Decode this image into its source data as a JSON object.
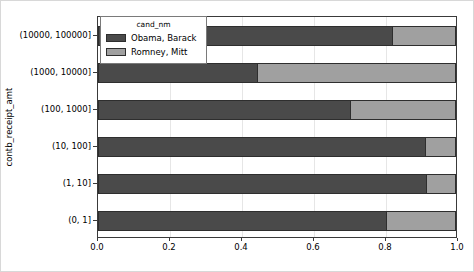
{
  "chart_data": {
    "type": "bar",
    "orientation": "horizontal",
    "stacked": true,
    "normalized": true,
    "title": "",
    "xlabel": "",
    "ylabel": "contb_receipt_amt",
    "xlim": [
      0.0,
      1.0
    ],
    "xticks": [
      "0.0",
      "0.2",
      "0.4",
      "0.6",
      "0.8",
      "1.0"
    ],
    "xtick_values": [
      0.0,
      0.2,
      0.4,
      0.6,
      0.8,
      1.0
    ],
    "grid": true,
    "categories": [
      "(0, 1]",
      "(1, 10]",
      "(10, 100]",
      "(100, 1000]",
      "(1000, 10000]",
      "(10000, 100000]"
    ],
    "legend": {
      "title": "cand_nm",
      "position": "upper left",
      "entries": [
        "Obama, Barack",
        "Romney, Mitt"
      ]
    },
    "series": [
      {
        "name": "Obama, Barack",
        "color": "#4a4a4a",
        "values": [
          0.805,
          0.917,
          0.913,
          0.705,
          0.443,
          0.822
        ]
      },
      {
        "name": "Romney, Mitt",
        "color": "#a0a0a0",
        "values": [
          0.195,
          0.083,
          0.087,
          0.295,
          0.557,
          0.178
        ]
      }
    ]
  },
  "figure": {
    "background_color": "#ffffff",
    "axes_edge_color": "#3a3a3a",
    "grid_color": "#e6e6e6",
    "border_color": "#d8d8d8"
  }
}
